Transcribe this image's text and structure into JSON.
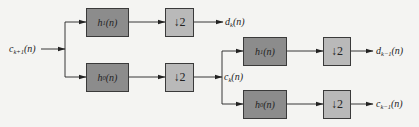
{
  "diagram": {
    "type": "two-level wavelet decomposition filter bank",
    "input": {
      "base": "c",
      "sub": "k+1",
      "arg": "(n)"
    },
    "stage1": {
      "high_filter": {
        "base": "h",
        "sub": "1",
        "arg": "(n)"
      },
      "low_filter": {
        "base": "h",
        "sub": "0",
        "arg": "(n)"
      },
      "downsample_high": "↓2",
      "downsample_low": "↓2",
      "detail_output": {
        "base": "d",
        "sub": "k",
        "arg": "(n)"
      },
      "approx_output": {
        "base": "c",
        "sub": "k",
        "arg": "(n)"
      }
    },
    "stage2": {
      "high_filter": {
        "base": "h",
        "sub": "1",
        "arg": "(n)"
      },
      "low_filter": {
        "base": "h",
        "sub": "0",
        "arg": "(n)"
      },
      "downsample_high": "↓2",
      "downsample_low": "↓2",
      "detail_output": {
        "base": "d",
        "sub": "k−1",
        "arg": "(n)"
      },
      "approx_output": {
        "base": "c",
        "sub": "k−1",
        "arg": "(n)"
      }
    },
    "colors": {
      "filter_box": "#8c8c8c",
      "downsample_box": "#b9b9b9",
      "line": "#222222",
      "background": "#f4f4f2"
    }
  }
}
